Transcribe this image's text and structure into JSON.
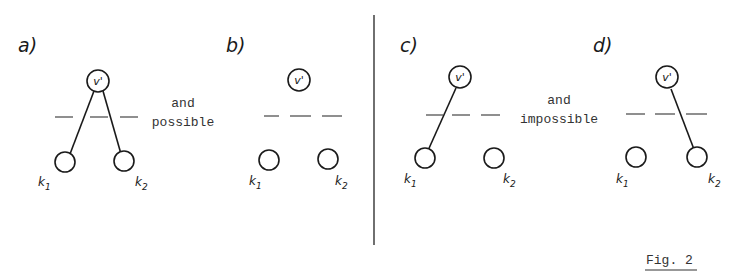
{
  "figure": {
    "caption": "Fig. 2",
    "colors": {
      "ink": "#1a1a1a",
      "background": "#ffffff"
    }
  },
  "groups": [
    {
      "id": "possible",
      "connector_top": "and",
      "connector_bottom": "possible",
      "panels": [
        "a",
        "b"
      ]
    },
    {
      "id": "impossible",
      "connector_top": "and",
      "connector_bottom": "impossible",
      "panels": [
        "c",
        "d"
      ]
    }
  ],
  "panels": {
    "a": {
      "label": "a)",
      "top_node": "v'",
      "k1": "k",
      "k1_sub": "1",
      "k2": "k",
      "k2_sub": "2",
      "edges": [
        "v'-k1",
        "v'-k2"
      ]
    },
    "b": {
      "label": "b)",
      "top_node": "v'",
      "k1": "k",
      "k1_sub": "1",
      "k2": "k",
      "k2_sub": "2",
      "edges": []
    },
    "c": {
      "label": "c)",
      "top_node": "v'",
      "k1": "k",
      "k1_sub": "1",
      "k2": "k",
      "k2_sub": "2",
      "edges": [
        "v'-k1"
      ]
    },
    "d": {
      "label": "d)",
      "top_node": "v'",
      "k1": "k",
      "k1_sub": "1",
      "k2": "k",
      "k2_sub": "2",
      "edges": [
        "v'-k2"
      ]
    }
  }
}
